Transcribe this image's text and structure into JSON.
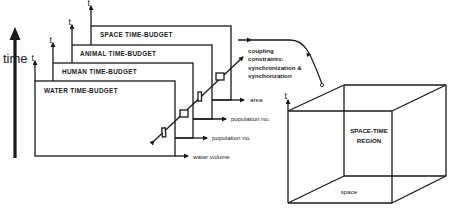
{
  "diagram": {
    "time_axis_label": "time",
    "axis_t": "t",
    "budgets": [
      {
        "label": "WATER TIME-BUDGET",
        "output": "water volume"
      },
      {
        "label": "HUMAN TIME-BUDGET",
        "output": "population no."
      },
      {
        "label": "ANIMAL TIME-BUDGET",
        "output": "population no."
      },
      {
        "label": "SPACE TIME-BUDGET",
        "output": "area"
      }
    ],
    "coupling": {
      "line1": "coupling",
      "line2": "constraints:",
      "line3": "synchronization &",
      "line4": "synchorization"
    },
    "cube": {
      "region_line1": "SPACE-TIME",
      "region_line2": "REGION",
      "base_label": "space",
      "axis_label": "t"
    },
    "colors": {
      "ink": "#1a1a1a",
      "background": "#ffffff"
    }
  }
}
